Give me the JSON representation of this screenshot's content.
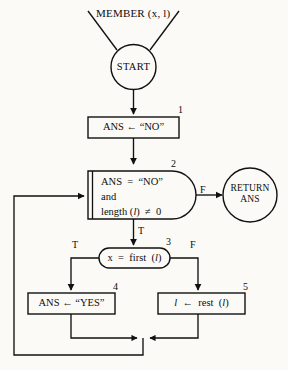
{
  "diagram": {
    "title": "MEMBER (x, l)",
    "caller": {
      "label": "MEMBER (x, l)",
      "name": "MEMBER",
      "args": "(x, l)"
    },
    "terminals": [
      {
        "id": "start",
        "label": "START",
        "shape": "circle"
      },
      {
        "id": "return",
        "label": "RETURN ANS",
        "line1": "RETURN",
        "line2": "ANS",
        "shape": "circle"
      }
    ],
    "nodes": [
      {
        "id": "node1",
        "step": "1",
        "shape": "rect",
        "text": "ANS ← “NO”",
        "lines": [
          "ANS ← “NO”"
        ]
      },
      {
        "id": "node2",
        "step": "2",
        "shape": "decision-bracket",
        "text": "ANS = “NO” and length (l) ≠ 0",
        "lines": [
          "ANS = “NO”",
          "and",
          "length (l) ≠ 0"
        ],
        "line1": "ANS  =  “NO”",
        "line2": "and",
        "line3_a": "length (",
        "line3_b": "l",
        "line3_c": ")  ≠  0"
      },
      {
        "id": "node3",
        "step": "3",
        "shape": "stadium",
        "text": "x = first (l)",
        "pre": "x  =  first  (",
        "ital": "l",
        "post": ")"
      },
      {
        "id": "node4",
        "step": "4",
        "shape": "rect",
        "text": "ANS ← “YES”",
        "lines": [
          "ANS ← “YES”"
        ]
      },
      {
        "id": "node5",
        "step": "5",
        "shape": "rect",
        "text": "l ← rest (l)",
        "pre": "l",
        "mid": "  ←  rest  (",
        "ital": "l",
        "post": ")"
      }
    ],
    "branch_labels": {
      "node2_false": "F",
      "node2_true": "T",
      "node3_true": "T",
      "node3_false": "F"
    },
    "colors": {
      "ink": "#0d0d0d",
      "paper": "#fbfaf7",
      "stroke": "#111111"
    }
  }
}
